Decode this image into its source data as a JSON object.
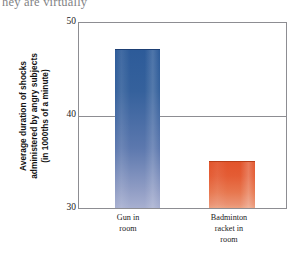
{
  "page": {
    "bleed_text": "hey are virtually"
  },
  "chart_data": {
    "type": "bar",
    "title": "",
    "xlabel": "",
    "ylabel": "Average duration of shocks\nadministered by angry subjects\n(in 1000ths of a minute)",
    "categories": [
      "Gun in\nroom",
      "Badminton\nracket in\nroom"
    ],
    "values": [
      47.2,
      35.1
    ],
    "ylim": [
      30,
      50
    ],
    "yticks": [
      30,
      40,
      50
    ],
    "ytick_labels": [
      "30",
      "40",
      "50"
    ],
    "grid": true,
    "legend": "none",
    "series": [
      {
        "name": "Average shock duration",
        "values": [
          47.2,
          35.1
        ],
        "colors": [
          "#2d5b99",
          "#e2542b"
        ]
      }
    ],
    "bar_colors": {
      "gun_top": "#2d5b99",
      "gun_bottom": "#a7afd0",
      "racket_top": "#e2542b",
      "racket_bottom": "#eca07f"
    },
    "axis_color": "#8d8d92"
  }
}
